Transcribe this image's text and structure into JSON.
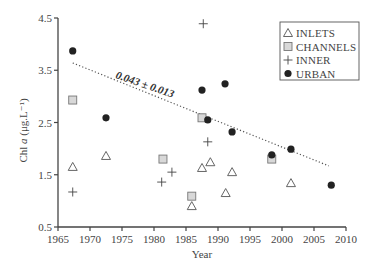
{
  "chart_data": {
    "type": "scatter",
    "title": "",
    "xlabel": "Year",
    "ylabel": "Chl a (μg.L⁻¹)",
    "xlim": [
      1965,
      2010
    ],
    "ylim": [
      0.5,
      4.5
    ],
    "xticks": [
      1965,
      1970,
      1975,
      1980,
      1985,
      1990,
      1995,
      2000,
      2005,
      2010
    ],
    "yticks": [
      0.5,
      1.5,
      2.5,
      3.5,
      4.5
    ],
    "xtick_labels": [
      "1965",
      "1970",
      "1975",
      "1980",
      "1985",
      "1990",
      "1995",
      "2000",
      "2005",
      "2010"
    ],
    "ytick_labels": [
      "0.5",
      "1.5",
      "2.5",
      "3.5",
      "4.5"
    ],
    "grid": false,
    "legend_position": "upper right",
    "series": [
      {
        "name": "INLETS",
        "marker": "triangle-open",
        "points": [
          [
            1967.3,
            1.65
          ],
          [
            1972.5,
            1.86
          ],
          [
            1985.9,
            0.9
          ],
          [
            1987.5,
            1.63
          ],
          [
            1988.8,
            1.74
          ],
          [
            1991.2,
            1.15
          ],
          [
            1992.2,
            1.55
          ],
          [
            2001.4,
            1.34
          ]
        ]
      },
      {
        "name": "CHANNELS",
        "marker": "square-gray",
        "points": [
          [
            1967.3,
            2.93
          ],
          [
            1981.4,
            1.8
          ],
          [
            1985.9,
            1.09
          ],
          [
            1987.5,
            2.59
          ],
          [
            1998.4,
            1.8
          ]
        ]
      },
      {
        "name": "INNER",
        "marker": "plus",
        "points": [
          [
            1967.3,
            1.17
          ],
          [
            1981.2,
            1.36
          ],
          [
            1982.8,
            1.55
          ],
          [
            1987.7,
            4.39
          ],
          [
            1988.4,
            2.13
          ]
        ]
      },
      {
        "name": "URBAN",
        "marker": "circle-filled",
        "points": [
          [
            1967.3,
            3.87
          ],
          [
            1972.5,
            2.59
          ],
          [
            1987.5,
            3.12
          ],
          [
            1988.4,
            2.55
          ],
          [
            1991.1,
            3.24
          ],
          [
            1992.2,
            2.32
          ],
          [
            1998.4,
            1.88
          ],
          [
            2001.4,
            1.99
          ],
          [
            2007.7,
            1.3
          ]
        ]
      }
    ],
    "trendline": {
      "style": "dotted",
      "from": [
        1967.3,
        3.64
      ],
      "to": [
        2007.3,
        1.67
      ],
      "label": "0.043 ± 0.013"
    },
    "annotations": [
      "0.043 ± 0.013"
    ]
  },
  "legend": {
    "items": [
      {
        "label": "INLETS",
        "symbol": "△"
      },
      {
        "label": "CHANNELS",
        "symbol": "□"
      },
      {
        "label": "INNER",
        "symbol": "+"
      },
      {
        "label": "URBAN",
        "symbol": "●"
      }
    ]
  },
  "colors": {
    "axis": "#444444",
    "urban": "#222222",
    "channels_fill": "#d8d8d8",
    "channels_stroke": "#777777",
    "inlets_stroke": "#555555",
    "inner_stroke": "#444444",
    "trendline": "#555555"
  }
}
